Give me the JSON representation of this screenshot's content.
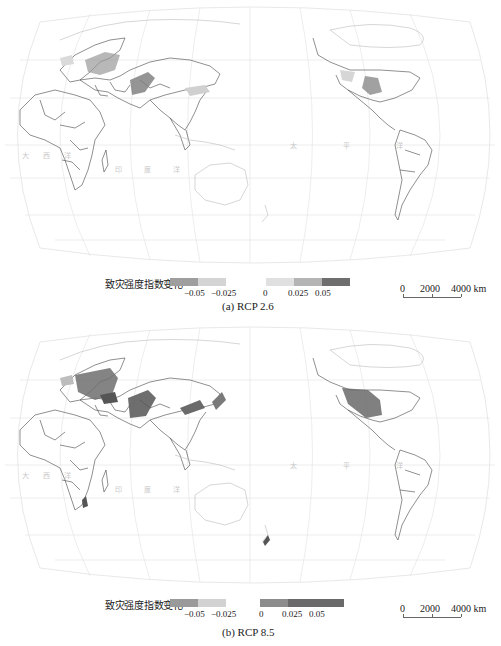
{
  "figure": {
    "panels": [
      {
        "id": "a",
        "scenario": "RCP 2.6",
        "caption": "(a) RCP 2.6",
        "legend": {
          "title": "致灾强度指数变化",
          "negative_ticks": [
            "−0.05",
            "−0.025"
          ],
          "positive_ticks": [
            "0",
            "0.025",
            "0.05"
          ],
          "negative_colors": [
            "#9e9e9e",
            "#d4d4d4"
          ],
          "positive_colors": [
            "#e0e0e0",
            "#b4b4b4",
            "#6e6e6e"
          ]
        },
        "scale_bar": {
          "labels": [
            "0",
            "2000",
            "4000 km"
          ]
        },
        "ocean_labels": [
          "大 西 洋",
          "印 度 洋",
          "太 平 洋"
        ]
      },
      {
        "id": "b",
        "scenario": "RCP 8.5",
        "caption": "(b) RCP 8.5",
        "legend": {
          "title": "致灾强度指数变化",
          "negative_ticks": [
            "−0.05",
            "−0.025"
          ],
          "positive_ticks": [
            "0",
            "0.025",
            "0.05"
          ],
          "negative_colors": [
            "#9a9a9a",
            "#d2d2d2"
          ],
          "positive_colors": [
            "#8c8c8c",
            "#6a6a6a",
            "#6a6a6a"
          ]
        },
        "scale_bar": {
          "labels": [
            "0",
            "2000",
            "4000 km"
          ]
        },
        "ocean_labels": [
          "大 西 洋",
          "印 度 洋",
          "太 平 洋"
        ]
      }
    ],
    "colors": {
      "graticule": "#dcdcdc",
      "coastline": "#bdbdbd",
      "border": "#333333",
      "hazard_dark": "#555555",
      "hazard_mid": "#8a8a8a",
      "hazard_light": "#c4c4c4"
    }
  }
}
